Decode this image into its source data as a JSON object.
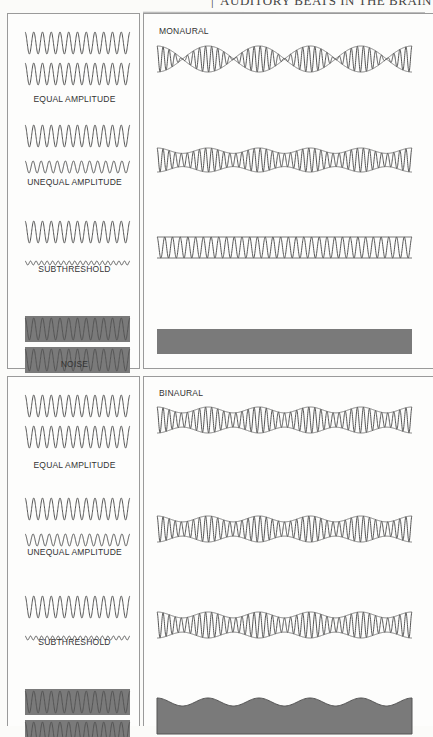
{
  "page": {
    "running_head": "AUDITORY BEATS IN THE BRAIN",
    "page_number": ""
  },
  "colors": {
    "stroke": "#555555",
    "envelope": "#777777",
    "noise_fill": "#7a7a7a",
    "border": "#9a9a9a"
  },
  "figure": {
    "monaural": {
      "title": "MONAURAL",
      "conditions": [
        {
          "label": "EQUAL AMPLITUDE",
          "inputs": [
            {
              "amp": 1.0,
              "cycles": 12
            },
            {
              "amp": 1.0,
              "cycles": 12
            }
          ],
          "result": {
            "type": "beat",
            "depth": 1.0,
            "beats": 5
          }
        },
        {
          "label": "UNEQUAL AMPLITUDE",
          "inputs": [
            {
              "amp": 1.0,
              "cycles": 12
            },
            {
              "amp": 0.55,
              "cycles": 13
            }
          ],
          "result": {
            "type": "beat",
            "depth": 0.45,
            "beats": 5
          }
        },
        {
          "label": "SUBTHRESHOLD",
          "inputs": [
            {
              "amp": 1.0,
              "cycles": 12
            },
            {
              "amp": 0.18,
              "cycles": 19
            }
          ],
          "result": {
            "type": "steady",
            "cycles": 33
          }
        },
        {
          "label": "NOISE",
          "inputs": [
            {
              "amp": 1.0,
              "cycles": 12,
              "noise": true
            },
            {
              "amp": 1.0,
              "cycles": 12,
              "noise": true
            }
          ],
          "result": {
            "type": "noise-flat"
          }
        }
      ]
    },
    "binaural": {
      "title": "BINAURAL",
      "conditions": [
        {
          "label": "EQUAL AMPLITUDE",
          "inputs": [
            {
              "amp": 1.0,
              "cycles": 12
            },
            {
              "amp": 1.0,
              "cycles": 12
            }
          ],
          "result": {
            "type": "beat",
            "depth": 0.45,
            "beats": 5
          }
        },
        {
          "label": "UNEQUAL AMPLITUDE",
          "inputs": [
            {
              "amp": 1.0,
              "cycles": 12
            },
            {
              "amp": 0.55,
              "cycles": 13
            }
          ],
          "result": {
            "type": "beat",
            "depth": 0.45,
            "beats": 5
          }
        },
        {
          "label": "SUBTHRESHOLD",
          "inputs": [
            {
              "amp": 1.0,
              "cycles": 12
            },
            {
              "amp": 0.18,
              "cycles": 19
            }
          ],
          "result": {
            "type": "beat",
            "depth": 0.45,
            "beats": 5
          }
        },
        {
          "label": "NOISE",
          "inputs": [
            {
              "amp": 1.0,
              "cycles": 12,
              "noise": true
            },
            {
              "amp": 1.0,
              "cycles": 12,
              "noise": true
            }
          ],
          "result": {
            "type": "noise-wavy",
            "beats": 5
          }
        }
      ]
    }
  }
}
